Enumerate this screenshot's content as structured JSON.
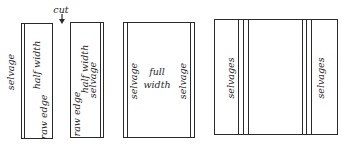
{
  "diagram": {
    "panels": [
      {
        "id": "half-width-1",
        "labels": {
          "outside": "selvage",
          "center": "half width",
          "edge": "raw edge"
        }
      },
      {
        "id": "half-width-2",
        "labels": {
          "edge": "raw edge",
          "center": "half width",
          "selvage": "selvage"
        }
      },
      {
        "id": "full-width",
        "labels": {
          "left": "selvage",
          "center_line1": "full",
          "center_line2": "width",
          "right": "selvage"
        }
      },
      {
        "id": "joined-widths",
        "labels": {
          "left": "selvages",
          "right": "selvages"
        }
      }
    ],
    "cut_label": "cut",
    "colors": {
      "line": "#2a2a2a",
      "background": "#ffffff"
    }
  }
}
